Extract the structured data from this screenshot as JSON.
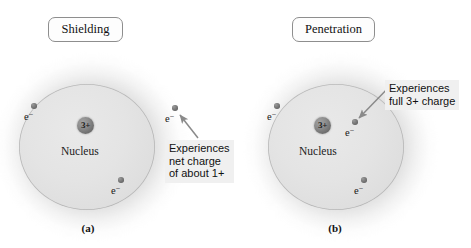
{
  "figure": {
    "background_color": "#ffffff",
    "width": 471,
    "height": 248
  },
  "panels": [
    {
      "id": "a",
      "title": "Shielding",
      "caption": "(a)",
      "nucleus": {
        "charge": "3+",
        "label": "Nucleus"
      },
      "electrons": [
        {
          "name": "electron-upper-left",
          "label": "e",
          "superscript": "−"
        },
        {
          "name": "electron-lower-right",
          "label": "e",
          "superscript": "−"
        },
        {
          "name": "electron-outer-right",
          "label": "e",
          "superscript": "−"
        }
      ],
      "callout": {
        "lines": [
          "Experiences",
          "net charge",
          "of about 1+"
        ],
        "background_color": "#f0f0f0",
        "points_to": "electron-outer-right"
      }
    },
    {
      "id": "b",
      "title": "Penetration",
      "caption": "(b)",
      "nucleus": {
        "charge": "3+",
        "label": "Nucleus"
      },
      "electrons": [
        {
          "name": "electron-upper-left",
          "label": "e",
          "superscript": "−"
        },
        {
          "name": "electron-lower-right",
          "label": "e",
          "superscript": "−"
        },
        {
          "name": "electron-penetrating",
          "label": "e",
          "superscript": "−"
        }
      ],
      "callout": {
        "lines": [
          "Experiences",
          "full 3+ charge"
        ],
        "background_color": "#f0f0f0",
        "points_to": "electron-penetrating"
      }
    }
  ],
  "colors": {
    "nucleus_fill": "#6f6f6f",
    "electron_fill": "#7a7a7a",
    "cloud_fill": "#c8c8c8",
    "inner_sphere_fill": "#e4e4e4",
    "arrow_stroke": "#8a8a8a",
    "text": "#111111"
  }
}
